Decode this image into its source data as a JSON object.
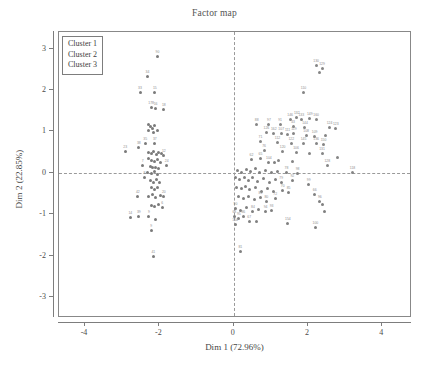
{
  "chart_data": {
    "type": "scatter",
    "title": "Factor map",
    "xlabel": "Dim 1 (72.96%)",
    "ylabel": "Dim 2 (22.85%)",
    "xlim": [
      -4.7,
      4.8
    ],
    "ylim": [
      -3.5,
      3.4
    ],
    "xticks": [
      -4,
      -2,
      0,
      2,
      4
    ],
    "xtick_labels": [
      "-4",
      "-2",
      "0",
      "2",
      "4"
    ],
    "yticks": [
      -3,
      -2,
      -1,
      0,
      1,
      2,
      3
    ],
    "ytick_labels": [
      "-3",
      "-2",
      "-1",
      "0",
      "1",
      "2",
      "3"
    ],
    "grid": false,
    "reference_lines": {
      "vertical_at": 0,
      "horizontal_at": 0,
      "style": "dashed"
    },
    "legend": {
      "position": "top-left",
      "entries": [
        "Cluster 1",
        "Cluster 2",
        "Cluster 3"
      ]
    },
    "colors": {
      "cluster1": "#7a7a7a",
      "cluster2": "#858585",
      "cluster3": "#808080",
      "axis": "#7d7d7d",
      "text": "#4a4a4a",
      "label": "#8e8e8e",
      "background": "#ffffff"
    },
    "series": [
      {
        "name": "Cluster 1",
        "points": [
          {
            "x": -2.05,
            "y": 2.82,
            "label": "90"
          },
          {
            "x": -2.32,
            "y": 2.32,
            "label": "34"
          },
          {
            "x": -2.52,
            "y": 1.93,
            "label": "33"
          },
          {
            "x": -2.12,
            "y": 1.93,
            "label": "15"
          },
          {
            "x": -2.22,
            "y": 1.58,
            "label": "178"
          },
          {
            "x": -2.1,
            "y": 1.56,
            "label": "16"
          },
          {
            "x": -1.88,
            "y": 1.52,
            "label": "18"
          },
          {
            "x": -2.3,
            "y": 1.18,
            "label": ""
          },
          {
            "x": -2.24,
            "y": 1.12,
            "label": ""
          },
          {
            "x": -2.18,
            "y": 1.08,
            "label": ""
          },
          {
            "x": -2.12,
            "y": 1.14,
            "label": ""
          },
          {
            "x": -2.28,
            "y": 1.02,
            "label": ""
          },
          {
            "x": -2.16,
            "y": 0.98,
            "label": ""
          },
          {
            "x": -2.05,
            "y": 1.02,
            "label": ""
          },
          {
            "x": -2.55,
            "y": 0.62,
            "label": "38"
          },
          {
            "x": -2.38,
            "y": 0.7,
            "label": "35"
          },
          {
            "x": -2.12,
            "y": 0.72,
            "label": "37"
          },
          {
            "x": -2.92,
            "y": 0.52,
            "label": "23"
          },
          {
            "x": -2.3,
            "y": 0.5,
            "label": ""
          },
          {
            "x": -2.22,
            "y": 0.46,
            "label": ""
          },
          {
            "x": -2.15,
            "y": 0.52,
            "label": ""
          },
          {
            "x": -2.08,
            "y": 0.44,
            "label": ""
          },
          {
            "x": -2.02,
            "y": 0.5,
            "label": ""
          },
          {
            "x": -1.95,
            "y": 0.46,
            "label": ""
          },
          {
            "x": -1.88,
            "y": 0.42,
            "label": "12"
          },
          {
            "x": -2.28,
            "y": 0.34,
            "label": ""
          },
          {
            "x": -2.2,
            "y": 0.3,
            "label": ""
          },
          {
            "x": -2.12,
            "y": 0.28,
            "label": ""
          },
          {
            "x": -2.05,
            "y": 0.32,
            "label": ""
          },
          {
            "x": -1.98,
            "y": 0.26,
            "label": ""
          },
          {
            "x": -2.45,
            "y": 0.18,
            "label": "7"
          },
          {
            "x": -2.25,
            "y": 0.16,
            "label": ""
          },
          {
            "x": -2.18,
            "y": 0.12,
            "label": ""
          },
          {
            "x": -2.1,
            "y": 0.14,
            "label": ""
          },
          {
            "x": -2.02,
            "y": 0.1,
            "label": ""
          },
          {
            "x": -1.8,
            "y": 0.18,
            "label": "24"
          },
          {
            "x": -2.32,
            "y": 0.02,
            "label": ""
          },
          {
            "x": -2.22,
            "y": -0.02,
            "label": ""
          },
          {
            "x": -2.14,
            "y": 0.04,
            "label": ""
          },
          {
            "x": -2.06,
            "y": -0.04,
            "label": ""
          },
          {
            "x": -2.4,
            "y": -0.12,
            "label": "8"
          },
          {
            "x": -2.24,
            "y": -0.18,
            "label": ""
          },
          {
            "x": -2.16,
            "y": -0.22,
            "label": ""
          },
          {
            "x": -2.08,
            "y": -0.16,
            "label": ""
          },
          {
            "x": -2.0,
            "y": -0.24,
            "label": ""
          },
          {
            "x": -2.2,
            "y": -0.34,
            "label": ""
          },
          {
            "x": -2.12,
            "y": -0.4,
            "label": ""
          },
          {
            "x": -2.04,
            "y": -0.36,
            "label": ""
          },
          {
            "x": -2.58,
            "y": -0.58,
            "label": "42"
          },
          {
            "x": -2.3,
            "y": -0.56,
            "label": ""
          },
          {
            "x": -2.18,
            "y": -0.52,
            "label": ""
          },
          {
            "x": -2.1,
            "y": -0.6,
            "label": ""
          },
          {
            "x": -1.98,
            "y": -0.54,
            "label": ""
          },
          {
            "x": -1.88,
            "y": -0.58,
            "label": "20"
          },
          {
            "x": -2.22,
            "y": -0.78,
            "label": ""
          },
          {
            "x": -2.12,
            "y": -0.82,
            "label": ""
          },
          {
            "x": -2.02,
            "y": -0.76,
            "label": ""
          },
          {
            "x": -1.92,
            "y": -0.84,
            "label": "6"
          },
          {
            "x": -2.78,
            "y": -1.08,
            "label": "14"
          },
          {
            "x": -2.55,
            "y": -1.06,
            "label": "39"
          },
          {
            "x": -2.28,
            "y": -1.04,
            "label": "9"
          },
          {
            "x": -2.1,
            "y": -1.12,
            "label": ""
          },
          {
            "x": -2.22,
            "y": -1.38,
            "label": "9"
          },
          {
            "x": -2.16,
            "y": -2.02,
            "label": "41"
          }
        ]
      },
      {
        "name": "Cluster 2",
        "points": [
          {
            "x": 2.22,
            "y": 2.58,
            "label": "130"
          },
          {
            "x": 2.38,
            "y": 2.52,
            "label": "129"
          },
          {
            "x": 2.3,
            "y": 2.42,
            "label": ""
          },
          {
            "x": 1.88,
            "y": 1.95,
            "label": "110"
          },
          {
            "x": 1.52,
            "y": 1.3,
            "label": "146"
          },
          {
            "x": 1.7,
            "y": 1.34,
            "label": "132"
          },
          {
            "x": 1.82,
            "y": 1.28,
            "label": "133"
          },
          {
            "x": 2.05,
            "y": 1.32,
            "label": "149"
          },
          {
            "x": 2.22,
            "y": 1.28,
            "label": "160"
          },
          {
            "x": 0.62,
            "y": 1.18,
            "label": "88"
          },
          {
            "x": 0.95,
            "y": 1.16,
            "label": "97"
          },
          {
            "x": 1.25,
            "y": 1.18,
            "label": "91"
          },
          {
            "x": 1.6,
            "y": 1.12,
            "label": "43"
          },
          {
            "x": 1.92,
            "y": 1.1,
            "label": "144"
          },
          {
            "x": 2.58,
            "y": 1.1,
            "label": "124"
          },
          {
            "x": 2.75,
            "y": 1.06,
            "label": "123"
          },
          {
            "x": 0.88,
            "y": 0.98,
            "label": "126"
          },
          {
            "x": 1.08,
            "y": 0.94,
            "label": "162"
          },
          {
            "x": 1.28,
            "y": 0.96,
            "label": "107"
          },
          {
            "x": 1.45,
            "y": 0.92,
            "label": "111"
          },
          {
            "x": 1.62,
            "y": 0.94,
            "label": "119"
          },
          {
            "x": 1.95,
            "y": 0.9,
            "label": "108"
          },
          {
            "x": 2.18,
            "y": 0.88,
            "label": "109"
          },
          {
            "x": 2.48,
            "y": 0.9,
            "label": ""
          },
          {
            "x": 0.72,
            "y": 0.76,
            "label": "71"
          },
          {
            "x": 1.18,
            "y": 0.74,
            "label": "112"
          },
          {
            "x": 1.55,
            "y": 0.72,
            "label": "122"
          },
          {
            "x": 1.88,
            "y": 0.7,
            "label": "145"
          },
          {
            "x": 2.22,
            "y": 0.72,
            "label": "136"
          },
          {
            "x": 2.42,
            "y": 0.68,
            "label": "150"
          },
          {
            "x": 0.82,
            "y": 0.54,
            "label": "76"
          },
          {
            "x": 1.32,
            "y": 0.52,
            "label": "120"
          },
          {
            "x": 1.68,
            "y": 0.5,
            "label": "106"
          },
          {
            "x": 2.05,
            "y": 0.48,
            "label": ""
          },
          {
            "x": 2.38,
            "y": 0.46,
            "label": "131"
          },
          {
            "x": 2.8,
            "y": 0.38,
            "label": ""
          },
          {
            "x": 1.22,
            "y": 0.3,
            "label": ""
          },
          {
            "x": 1.58,
            "y": 0.28,
            "label": ""
          },
          {
            "x": 3.2,
            "y": 0.02,
            "label": "118"
          },
          {
            "x": 2.52,
            "y": 0.18,
            "label": "128"
          }
        ]
      },
      {
        "name": "Cluster 3",
        "points": [
          {
            "x": 0.48,
            "y": 0.32,
            "label": "62"
          },
          {
            "x": 0.72,
            "y": 0.34,
            "label": "65"
          },
          {
            "x": 0.95,
            "y": 0.24,
            "label": "104"
          },
          {
            "x": 1.1,
            "y": 0.26,
            "label": ""
          },
          {
            "x": 0.1,
            "y": 0.06,
            "label": ""
          },
          {
            "x": 0.22,
            "y": 0.02,
            "label": ""
          },
          {
            "x": 0.34,
            "y": 0.08,
            "label": ""
          },
          {
            "x": 0.46,
            "y": 0.04,
            "label": ""
          },
          {
            "x": 0.58,
            "y": 0.1,
            "label": ""
          },
          {
            "x": 0.7,
            "y": 0.02,
            "label": ""
          },
          {
            "x": 0.86,
            "y": 0.06,
            "label": ""
          },
          {
            "x": 1.02,
            "y": 0.02,
            "label": ""
          },
          {
            "x": 1.18,
            "y": 0.04,
            "label": ""
          },
          {
            "x": 1.42,
            "y": 0.02,
            "label": "78"
          },
          {
            "x": 1.72,
            "y": -0.02,
            "label": "98"
          },
          {
            "x": 0.04,
            "y": -0.12,
            "label": ""
          },
          {
            "x": 0.16,
            "y": -0.16,
            "label": ""
          },
          {
            "x": 0.28,
            "y": -0.1,
            "label": ""
          },
          {
            "x": 0.4,
            "y": -0.18,
            "label": ""
          },
          {
            "x": 0.52,
            "y": -0.12,
            "label": ""
          },
          {
            "x": 0.64,
            "y": -0.2,
            "label": ""
          },
          {
            "x": 0.8,
            "y": -0.14,
            "label": ""
          },
          {
            "x": 0.96,
            "y": -0.22,
            "label": ""
          },
          {
            "x": 1.12,
            "y": -0.16,
            "label": ""
          },
          {
            "x": 1.28,
            "y": -0.24,
            "label": "79"
          },
          {
            "x": 1.58,
            "y": -0.18,
            "label": "92"
          },
          {
            "x": 2.02,
            "y": -0.28,
            "label": "99"
          },
          {
            "x": 0.08,
            "y": -0.34,
            "label": ""
          },
          {
            "x": 0.2,
            "y": -0.38,
            "label": ""
          },
          {
            "x": 0.32,
            "y": -0.32,
            "label": ""
          },
          {
            "x": 0.44,
            "y": -0.4,
            "label": ""
          },
          {
            "x": 0.6,
            "y": -0.36,
            "label": ""
          },
          {
            "x": 0.76,
            "y": -0.44,
            "label": ""
          },
          {
            "x": 0.92,
            "y": -0.38,
            "label": ""
          },
          {
            "x": 1.08,
            "y": -0.46,
            "label": ""
          },
          {
            "x": 1.32,
            "y": -0.42,
            "label": "70"
          },
          {
            "x": 1.48,
            "y": -0.48,
            "label": "85"
          },
          {
            "x": 2.18,
            "y": -0.52,
            "label": "66"
          },
          {
            "x": 0.12,
            "y": -0.58,
            "label": ""
          },
          {
            "x": 0.26,
            "y": -0.62,
            "label": ""
          },
          {
            "x": 0.4,
            "y": -0.56,
            "label": ""
          },
          {
            "x": 0.56,
            "y": -0.64,
            "label": ""
          },
          {
            "x": 0.72,
            "y": -0.6,
            "label": "81"
          },
          {
            "x": 0.88,
            "y": -0.68,
            "label": "80"
          },
          {
            "x": 1.12,
            "y": -0.62,
            "label": "72"
          },
          {
            "x": 2.32,
            "y": -0.68,
            "label": "96"
          },
          {
            "x": 2.4,
            "y": -0.76,
            "label": ""
          },
          {
            "x": 0.05,
            "y": -0.86,
            "label": "90"
          },
          {
            "x": 0.18,
            "y": -0.9,
            "label": ""
          },
          {
            "x": 0.34,
            "y": -0.84,
            "label": ""
          },
          {
            "x": 0.52,
            "y": -0.92,
            "label": "84"
          },
          {
            "x": 0.68,
            "y": -0.88,
            "label": ""
          },
          {
            "x": 0.86,
            "y": -0.94,
            "label": "94"
          },
          {
            "x": 1.02,
            "y": -0.9,
            "label": "93"
          },
          {
            "x": 2.44,
            "y": -0.92,
            "label": ""
          },
          {
            "x": 0.02,
            "y": -1.06,
            "label": "68"
          },
          {
            "x": 0.14,
            "y": -1.1,
            "label": "95"
          },
          {
            "x": 0.26,
            "y": -1.04,
            "label": "86"
          },
          {
            "x": 0.04,
            "y": -1.24,
            "label": "104"
          },
          {
            "x": 0.42,
            "y": -1.18,
            "label": "67"
          },
          {
            "x": 2.2,
            "y": -1.32,
            "label": "100"
          },
          {
            "x": 0.18,
            "y": -1.9,
            "label": "81"
          },
          {
            "x": 0.62,
            "y": -1.18,
            "label": ""
          },
          {
            "x": 1.46,
            "y": -1.22,
            "label": "154"
          }
        ]
      }
    ]
  }
}
